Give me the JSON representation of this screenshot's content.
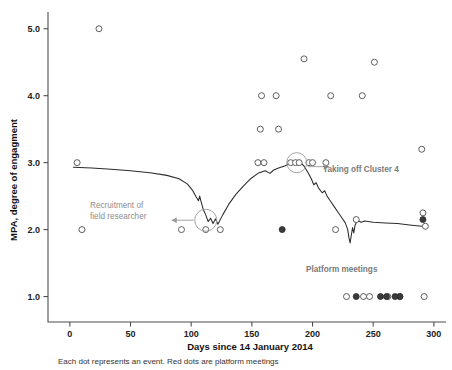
{
  "chart_data": {
    "type": "scatter",
    "title": "",
    "xlabel": "Days since 14 January 2014",
    "ylabel": "MPA, degree of engagment",
    "xlim": [
      -18,
      310
    ],
    "ylim": [
      0.62,
      5.25
    ],
    "xticks": [
      0,
      50,
      100,
      150,
      200,
      250,
      300
    ],
    "xtick_labels": [
      "0",
      "50",
      "100",
      "150",
      "200",
      "250",
      "300"
    ],
    "yticks": [
      1.0,
      2.0,
      3.0,
      4.0,
      5.0
    ],
    "ytick_labels": [
      "1.0",
      "2.0",
      "3.0",
      "4.0",
      "5.0"
    ],
    "grid": false,
    "legend_position": "none",
    "caption": "Each dot represents an event. Red dots are platform meetings",
    "series": [
      {
        "name": "Events (open dots)",
        "marker": "open-circle",
        "color": "#555555",
        "points": [
          [
            6,
            3.0
          ],
          [
            10,
            2.0
          ],
          [
            24,
            5.0
          ],
          [
            92,
            2.0
          ],
          [
            112,
            2.0
          ],
          [
            124,
            2.0
          ],
          [
            155,
            3.0
          ],
          [
            160,
            3.0
          ],
          [
            158,
            4.0
          ],
          [
            157,
            3.5
          ],
          [
            170,
            4.0
          ],
          [
            172,
            3.5
          ],
          [
            182,
            3.0
          ],
          [
            186,
            3.0
          ],
          [
            189,
            3.0
          ],
          [
            193,
            4.55
          ],
          [
            197,
            3.0
          ],
          [
            200,
            3.0
          ],
          [
            211,
            3.0
          ],
          [
            215,
            4.0
          ],
          [
            219,
            2.0
          ],
          [
            228,
            1.0
          ],
          [
            236,
            2.15
          ],
          [
            241,
            4.0
          ],
          [
            242,
            1.0
          ],
          [
            247,
            1.0
          ],
          [
            251,
            4.5
          ],
          [
            262,
            1.0
          ],
          [
            272,
            1.0
          ],
          [
            290,
            3.2
          ],
          [
            291,
            2.25
          ],
          [
            292,
            1.0
          ],
          [
            293,
            2.05
          ]
        ]
      },
      {
        "name": "Platform meetings (red dots)",
        "marker": "filled-circle",
        "color": "#3a3a3a",
        "points": [
          [
            175,
            2.0
          ],
          [
            236,
            1.0
          ],
          [
            256,
            1.0
          ],
          [
            261,
            1.0
          ],
          [
            268,
            1.0
          ],
          [
            272,
            1.0
          ],
          [
            291,
            2.15
          ]
        ]
      }
    ],
    "trend_line": {
      "name": "MPA engagement trend",
      "color": "#2b2b2b",
      "points": [
        [
          3,
          2.93
        ],
        [
          18,
          2.92
        ],
        [
          34,
          2.9
        ],
        [
          50,
          2.88
        ],
        [
          66,
          2.85
        ],
        [
          80,
          2.81
        ],
        [
          90,
          2.76
        ],
        [
          97,
          2.68
        ],
        [
          101,
          2.59
        ],
        [
          104,
          2.49
        ],
        [
          106,
          2.43
        ],
        [
          107,
          2.5
        ],
        [
          108,
          2.43
        ],
        [
          110,
          2.3
        ],
        [
          112,
          2.22
        ],
        [
          114,
          2.12
        ],
        [
          116,
          2.17
        ],
        [
          118,
          2.09
        ],
        [
          120,
          2.16
        ],
        [
          122,
          2.08
        ],
        [
          126,
          2.22
        ],
        [
          131,
          2.38
        ],
        [
          137,
          2.53
        ],
        [
          143,
          2.65
        ],
        [
          149,
          2.76
        ],
        [
          155,
          2.84
        ],
        [
          161,
          2.88
        ],
        [
          165,
          2.84
        ],
        [
          168,
          2.89
        ],
        [
          172,
          2.92
        ],
        [
          177,
          2.95
        ],
        [
          182,
          2.99
        ],
        [
          186,
          3.02
        ],
        [
          190,
          3.0
        ],
        [
          193,
          2.95
        ],
        [
          196,
          2.86
        ],
        [
          199,
          2.76
        ],
        [
          201,
          2.67
        ],
        [
          203,
          2.7
        ],
        [
          205,
          2.62
        ],
        [
          208,
          2.55
        ],
        [
          210,
          2.58
        ],
        [
          212,
          2.5
        ],
        [
          215,
          2.42
        ],
        [
          218,
          2.34
        ],
        [
          221,
          2.26
        ],
        [
          224,
          2.18
        ],
        [
          227,
          2.1
        ],
        [
          229,
          2.0
        ],
        [
          230,
          1.88
        ],
        [
          231,
          1.8
        ],
        [
          232,
          1.92
        ],
        [
          233,
          2.03
        ],
        [
          234,
          1.95
        ],
        [
          235,
          2.06
        ],
        [
          237,
          2.14
        ],
        [
          240,
          2.11
        ],
        [
          243,
          2.13
        ],
        [
          250,
          2.11
        ],
        [
          260,
          2.1
        ],
        [
          270,
          2.09
        ],
        [
          280,
          2.07
        ],
        [
          290,
          2.05
        ]
      ]
    },
    "annotations": [
      {
        "id": "recruitment",
        "text_line1": "Recruitment of",
        "text_line2": "field researcher",
        "target_x": 112,
        "target_y": 2.14,
        "arrow_direction": "left",
        "highlight": "circle"
      },
      {
        "id": "cluster4",
        "text_line1": "Taking off Cluster 4",
        "text_line2": "",
        "target_x": 187,
        "target_y": 3.0,
        "arrow_direction": "right",
        "highlight": "circle"
      },
      {
        "id": "platform-meetings-group",
        "text_line1": "Platform meetings",
        "text_line2": "",
        "target_x": 250,
        "target_y": 1.45,
        "arrow_direction": "none",
        "highlight": "none"
      }
    ]
  },
  "colors": {
    "axis": "#4d4d4d",
    "trend": "#2b2b2b",
    "open_dot_stroke": "#555555",
    "red_dot_fill": "#3a3a3a",
    "annotation": "#9a9a9a",
    "background": "#ffffff"
  }
}
